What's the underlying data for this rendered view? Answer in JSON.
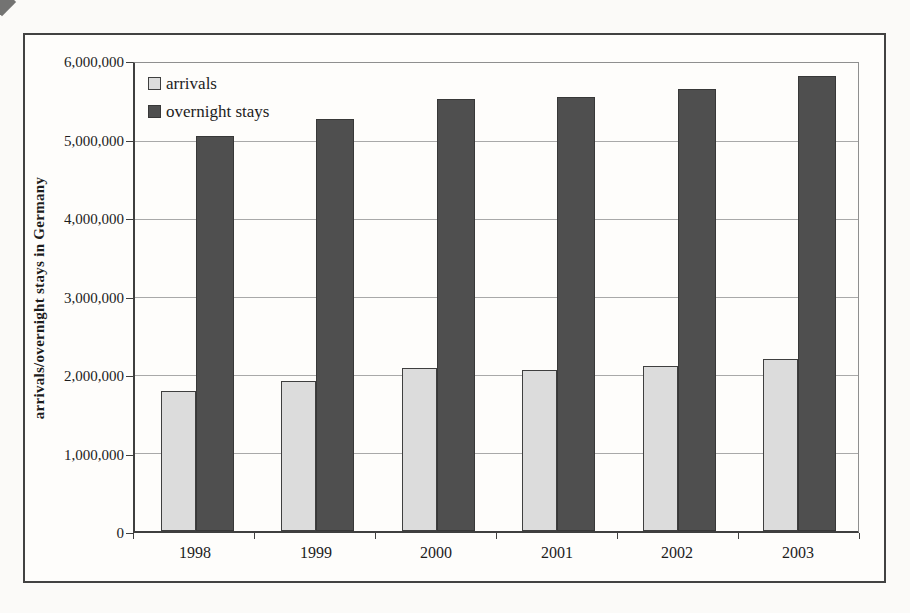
{
  "chart_data": {
    "type": "bar",
    "categories": [
      "1998",
      "1999",
      "2000",
      "2001",
      "2002",
      "2003"
    ],
    "series": [
      {
        "name": "arrivals",
        "fill": "#dcdcdc",
        "border": "#3f3f3f",
        "values": [
          1800000,
          1920000,
          2090000,
          2060000,
          2120000,
          2200000
        ]
      },
      {
        "name": "overnight stays",
        "fill": "#4f4f4f",
        "border": "#383838",
        "values": [
          5060000,
          5280000,
          5540000,
          5570000,
          5670000,
          5830000
        ]
      }
    ],
    "title": "",
    "xlabel": "",
    "ylabel": "arrivals/overnight stays in Germany",
    "ylim": [
      0,
      6000000
    ],
    "ytick_step": 1000000,
    "ytick_labels": [
      "0",
      "1,000,000",
      "2,000,000",
      "3,000,000",
      "4,000,000",
      "5,000,000",
      "6,000,000"
    ],
    "grid": true,
    "legend_position": "inside-top-left",
    "colors": {
      "gridline": "#a9a9a9",
      "axis": "#3f3f3f",
      "frame_border": "#424242",
      "plot_border_light": "#8f8f8f",
      "text": "#1c1c1c",
      "page_background": "#fbfaf8"
    }
  }
}
